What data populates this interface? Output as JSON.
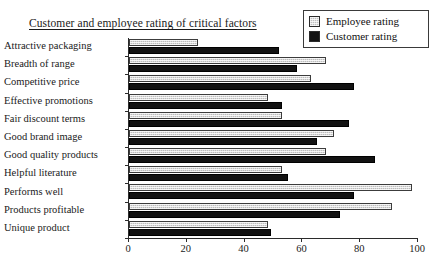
{
  "chart_data": {
    "type": "bar",
    "orientation": "horizontal",
    "title": "Customer and employee rating of critical factors",
    "xlabel": "",
    "ylabel": "",
    "xlim": [
      0,
      100
    ],
    "xticks": [
      0,
      20,
      40,
      60,
      80,
      100
    ],
    "grid": false,
    "legend_position": "top-right",
    "categories": [
      "Attractive packaging",
      "Breadth of range",
      "Competitive price",
      "Effective promotions",
      "Fair discount terms",
      "Good brand image",
      "Good quality products",
      "Helpful literature",
      "Performs well",
      "Products profitable",
      "Unique product"
    ],
    "series": [
      {
        "name": "Employee rating",
        "color": "#bcbcbc",
        "values": [
          24,
          68,
          63,
          48,
          53,
          71,
          68,
          53,
          98,
          91,
          48
        ]
      },
      {
        "name": "Customer rating",
        "color": "#121212",
        "values": [
          52,
          58,
          78,
          53,
          76,
          65,
          85,
          55,
          78,
          73,
          49
        ]
      }
    ]
  },
  "legend": {
    "items": [
      {
        "label": "Employee rating",
        "swatch": "employee-swatch"
      },
      {
        "label": "Customer rating",
        "swatch": "customer-swatch"
      }
    ]
  }
}
